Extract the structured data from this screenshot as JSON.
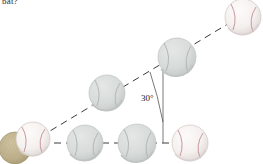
{
  "figure": {
    "caption_fragment": "bat?",
    "width": 263,
    "height": 164,
    "background_color": "#ffffff"
  },
  "annotations": {
    "angle_label": "30°",
    "angle_value_degrees": 30,
    "angle_label_x": 141,
    "angle_label_y": 99
  },
  "colors": {
    "dash_line": "#3a3a3a",
    "arc_line": "#555555",
    "ball_white": "#f7f4f2",
    "ball_white_shade": "#ddd8d6",
    "ball_seam_red": "#c08a8f",
    "ball_ghost": "#d6d9d8",
    "ball_ghost_shade": "#c2c7c6",
    "ball_ghost_seam": "#b9bfbe",
    "bat_tan": "#bdb08a",
    "bat_tan_shade": "#a79a74",
    "text": "#2b2b2b"
  },
  "lines": {
    "trajectory": {
      "name": "trajectory-dashed-line",
      "x1": 30,
      "y1": 143,
      "x2": 241,
      "y2": 16,
      "dash": "7 5",
      "width": 1
    },
    "horizontal_reference": {
      "name": "horizontal-dashed-line",
      "x1": 30,
      "y1": 143,
      "x2": 200,
      "y2": 143,
      "dash": "7 5",
      "width": 1
    },
    "vertical_reference": {
      "name": "vertical-reference-line",
      "x1": 163,
      "y1": 63,
      "x2": 163,
      "y2": 143,
      "width": 0.8
    },
    "angle_arc": {
      "name": "angle-arc",
      "path": "M 150 72 Q 159 94 163 120",
      "width": 0.8
    }
  },
  "balls": [
    {
      "id": "ball-bat-contact",
      "label": "bat-end",
      "type": "bat",
      "cx": 15,
      "cy": 148,
      "r": 16
    },
    {
      "id": "ball-launch",
      "label": "ball-at-launch",
      "type": "white",
      "cx": 33,
      "cy": 139,
      "r": 17
    },
    {
      "id": "ball-traj-1",
      "label": "ball-trajectory-1",
      "type": "ghost",
      "cx": 107,
      "cy": 93,
      "r": 18
    },
    {
      "id": "ball-traj-2",
      "label": "ball-trajectory-2",
      "type": "ghost",
      "cx": 177,
      "cy": 57,
      "r": 19
    },
    {
      "id": "ball-traj-3",
      "label": "ball-trajectory-3",
      "type": "white",
      "cx": 243,
      "cy": 17,
      "r": 18
    },
    {
      "id": "ball-horiz-1",
      "label": "ball-horizontal-1",
      "type": "ghost",
      "cx": 85,
      "cy": 143,
      "r": 18
    },
    {
      "id": "ball-horiz-2",
      "label": "ball-horizontal-2",
      "type": "ghost",
      "cx": 137,
      "cy": 143,
      "r": 19
    },
    {
      "id": "ball-horiz-3",
      "label": "ball-horizontal-3",
      "type": "white",
      "cx": 190,
      "cy": 143,
      "r": 18
    }
  ]
}
